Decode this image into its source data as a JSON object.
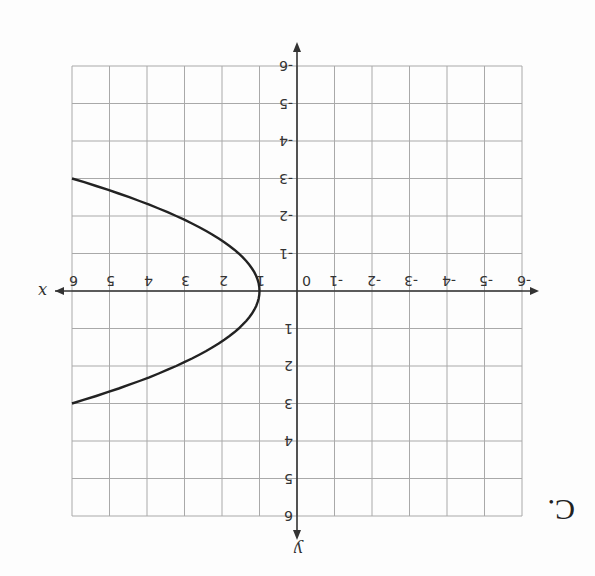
{
  "choice_label": "C.",
  "orientation": "rotated 180 degrees",
  "chart_data": {
    "type": "line",
    "title": "",
    "xlabel": "x",
    "ylabel": "y",
    "xlim": [
      -6,
      6
    ],
    "ylim": [
      -6,
      6
    ],
    "grid": true,
    "x_ticks": [
      "-6",
      "-5",
      "-4",
      "-3",
      "-2",
      "-1",
      "0",
      "1",
      "2",
      "3",
      "4",
      "5",
      "6"
    ],
    "y_ticks": [
      "-6",
      "-5",
      "-4",
      "-3",
      "-2",
      "-1",
      "1",
      "2",
      "3",
      "4",
      "5",
      "6"
    ],
    "series": [
      {
        "name": "parabola opening right",
        "equation": "x = (5/9)y^2 + 1",
        "x": [
          6,
          4.47,
          3.22,
          2.25,
          1.56,
          1.14,
          1,
          1.14,
          1.56,
          2.25,
          3.22,
          4.47,
          6
        ],
        "y": [
          -3,
          -2.5,
          -2,
          -1.5,
          -1,
          -0.5,
          0,
          0.5,
          1,
          1.5,
          2,
          2.5,
          3
        ]
      }
    ],
    "annotations": [
      "vertex at (1, 0)",
      "passes through (6, 3) and (6, -3)"
    ]
  },
  "labels": {
    "x_axis": "x",
    "y_axis": "y",
    "origin": "0",
    "x_pos": [
      "1",
      "2",
      "3",
      "4",
      "5",
      "6"
    ],
    "x_neg": [
      "-1",
      "-2",
      "-3",
      "-4",
      "-5",
      "-6"
    ],
    "y_pos": [
      "1",
      "2",
      "3",
      "4",
      "5",
      "6"
    ],
    "y_neg": [
      "-1",
      "-2",
      "-3",
      "-4",
      "-5",
      "-6"
    ]
  }
}
